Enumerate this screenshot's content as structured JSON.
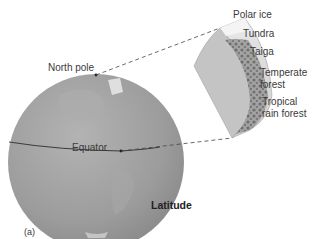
{
  "figure": {
    "panel_label": "(a)",
    "title": "Latitude",
    "globe": {
      "labels": {
        "north_pole": "North pole",
        "equator": "Equator"
      }
    },
    "wedge": {
      "biomes": [
        {
          "label_line1": "Polar ice",
          "label_line2": ""
        },
        {
          "label_line1": "Tundra",
          "label_line2": ""
        },
        {
          "label_line1": "Taiga",
          "label_line2": ""
        },
        {
          "label_line1": "Temperate",
          "label_line2": "forest"
        },
        {
          "label_line1": "Tropical",
          "label_line2": "rain forest"
        }
      ]
    },
    "colors": {
      "globe_fill": "#9a9a9a",
      "globe_light": "#b8b8b8",
      "wedge_side": "#c4c4c4",
      "wedge_face": "#dcdcdc",
      "vegetation": "#6e6e6e",
      "dashed_line": "#444444"
    }
  }
}
